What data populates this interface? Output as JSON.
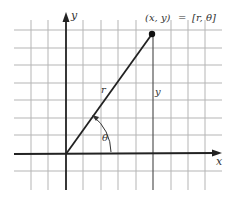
{
  "diagram": {
    "equation": {
      "left": "(x, y)",
      "equals": "=",
      "right": "[r, θ]"
    },
    "labels": {
      "x_axis": "x",
      "y_axis": "y",
      "radius": "r",
      "vertical_leg": "y",
      "angle": "θ"
    },
    "colors": {
      "grid": "#b5b5b5",
      "axis": "#222222",
      "line": "#222222",
      "text": "#333333"
    },
    "grid": {
      "vertical_x": [
        31,
        48,
        83,
        101,
        118,
        136,
        153,
        171,
        188,
        205
      ],
      "horizontal_y": [
        30,
        48,
        65,
        83,
        100,
        118,
        135,
        171
      ]
    },
    "origin": {
      "x": 66,
      "y": 154
    },
    "point": {
      "x": 152,
      "y": 34
    }
  }
}
